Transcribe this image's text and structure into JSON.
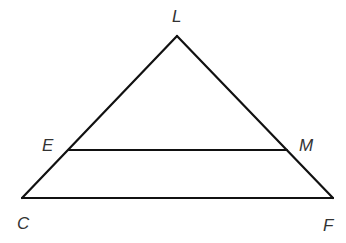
{
  "diagram": {
    "type": "triangle-with-midsegment",
    "points": {
      "L": {
        "label": "L",
        "x": 177,
        "y": 36,
        "lx": 178,
        "ly": 22
      },
      "E": {
        "label": "E",
        "x": 69,
        "y": 150,
        "lx": 48,
        "ly": 150
      },
      "M": {
        "label": "M",
        "x": 287,
        "y": 150,
        "lx": 309,
        "ly": 150
      },
      "C": {
        "label": "C",
        "x": 22,
        "y": 198,
        "lx": 24,
        "ly": 226
      },
      "F": {
        "label": "F",
        "x": 333,
        "y": 198,
        "lx": 328,
        "ly": 228
      }
    },
    "segments": [
      [
        "C",
        "L"
      ],
      [
        "L",
        "F"
      ],
      [
        "C",
        "F"
      ],
      [
        "E",
        "M"
      ]
    ],
    "stroke_color": "#111111",
    "label_color": "#333333"
  }
}
